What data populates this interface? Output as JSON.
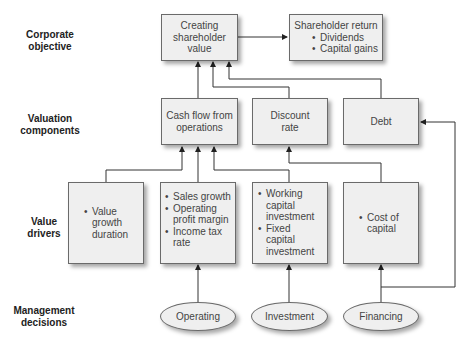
{
  "row_labels": {
    "corporate_objective": [
      "Corporate",
      "objective"
    ],
    "valuation_components": [
      "Valuation",
      "components"
    ],
    "value_drivers": [
      "Value",
      "drivers"
    ],
    "management_decisions": [
      "Management",
      "decisions"
    ]
  },
  "corporate_objective": {
    "creating_value": [
      "Creating",
      "shareholder",
      "value"
    ],
    "shareholder_return": {
      "title": "Shareholder return",
      "bullets": [
        "Dividends",
        "Capital gains"
      ]
    }
  },
  "valuation_components": {
    "cash_flow": [
      "Cash flow from",
      "operations"
    ],
    "discount_rate": [
      "Discount",
      "rate"
    ],
    "debt": [
      "Debt"
    ]
  },
  "value_drivers": {
    "duration": [
      "Value growth duration"
    ],
    "operating": [
      "Sales growth",
      "Operating profit margin",
      "Income tax rate"
    ],
    "investment": [
      "Working capital investment",
      "Fixed capital investment"
    ],
    "financing": [
      "Cost of capital"
    ]
  },
  "management_decisions": {
    "operating": "Operating",
    "investment": "Investment",
    "financing": "Financing"
  },
  "colors": {
    "box_fill": "#efefef",
    "border": "#6a6a6a",
    "line": "#333333"
  }
}
